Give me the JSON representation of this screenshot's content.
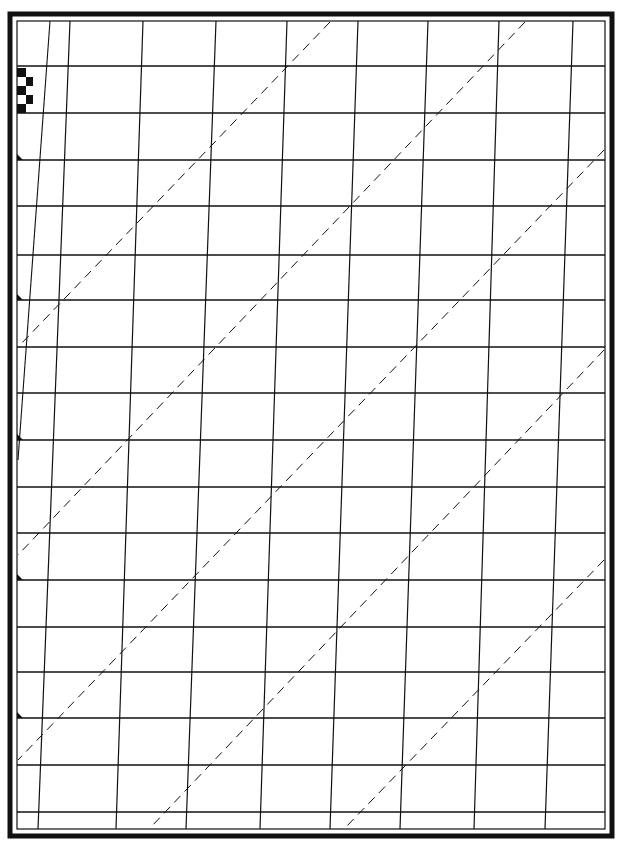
{
  "sheet": {
    "type": "calligraphy-practice-guide-sheet",
    "colors": {
      "paper": "#ffffff",
      "ink": "#111111"
    },
    "outer_frame": {
      "x": 10,
      "y": 14,
      "width": 602,
      "height": 822,
      "stroke_width": 5
    },
    "inner_frame": {
      "x": 17,
      "y": 21,
      "width": 588,
      "height": 808,
      "stroke_width": 1.2
    },
    "horizontal_lines_y": [
      66,
      113,
      160,
      206,
      255,
      300,
      347,
      393,
      440,
      487,
      533,
      580,
      627,
      672,
      718,
      765,
      812
    ],
    "slant_lines": [
      {
        "x_top": 70,
        "x_bottom": 38
      },
      {
        "x_top": 143,
        "x_bottom": 116
      },
      {
        "x_top": 216,
        "x_bottom": 186
      },
      {
        "x_top": 287,
        "x_bottom": 260
      },
      {
        "x_top": 358,
        "x_bottom": 330
      },
      {
        "x_top": 428,
        "x_bottom": 400
      },
      {
        "x_top": 499,
        "x_bottom": 474
      },
      {
        "x_top": 573,
        "x_bottom": 545
      }
    ],
    "dashed_diagonals": [
      {
        "x1": 330,
        "y1": 22,
        "x2": 20,
        "y2": 345
      },
      {
        "x1": 525,
        "y1": 22,
        "x2": 18,
        "y2": 555
      },
      {
        "x1": 604,
        "y1": 150,
        "x2": 18,
        "y2": 760
      },
      {
        "x1": 604,
        "y1": 350,
        "x2": 150,
        "y2": 828
      },
      {
        "x1": 604,
        "y1": 560,
        "x2": 345,
        "y2": 828
      }
    ],
    "nib_width_checker": [
      {
        "x": 17,
        "y": 68,
        "w": 9,
        "h": 9
      },
      {
        "x": 26,
        "y": 77,
        "w": 7,
        "h": 9
      },
      {
        "x": 17,
        "y": 86,
        "w": 9,
        "h": 9
      },
      {
        "x": 26,
        "y": 95,
        "w": 7,
        "h": 9
      },
      {
        "x": 17,
        "y": 104,
        "w": 9,
        "h": 9
      }
    ],
    "baseline_markers_y": [
      160,
      300,
      440,
      580,
      718
    ]
  }
}
